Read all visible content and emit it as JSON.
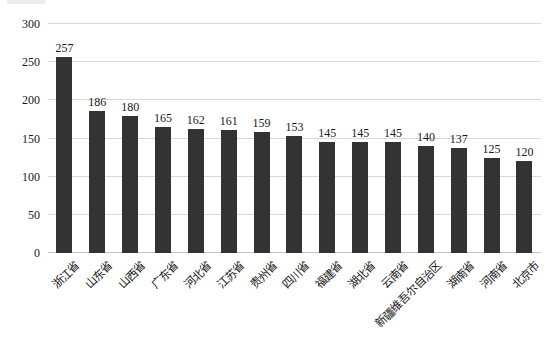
{
  "chart_data": {
    "type": "bar",
    "title": "",
    "categories": [
      "浙江省",
      "山东省",
      "山西省",
      "广东省",
      "河北省",
      "江苏省",
      "贵州省",
      "四川省",
      "福建省",
      "湖北省",
      "云南省",
      "新疆维吾尔自治区",
      "湖南省",
      "河南省",
      "北京市"
    ],
    "values": [
      257,
      186,
      180,
      165,
      162,
      161,
      159,
      153,
      145,
      145,
      145,
      140,
      137,
      125,
      120
    ],
    "xlabel": "",
    "ylabel": "",
    "ylim": [
      0,
      300
    ],
    "yticks": [
      0,
      50,
      100,
      150,
      200,
      250,
      300
    ],
    "grid": "horizontal",
    "legend": "none",
    "data_labels": "above-bars",
    "x_label_rotation_deg": 45,
    "bar_color": "#333333",
    "gridline_color": "#d9d9d9",
    "axis_line_color": "#c4c4c4",
    "text_color": "#1a1a1a",
    "background_color": "#ffffff"
  }
}
